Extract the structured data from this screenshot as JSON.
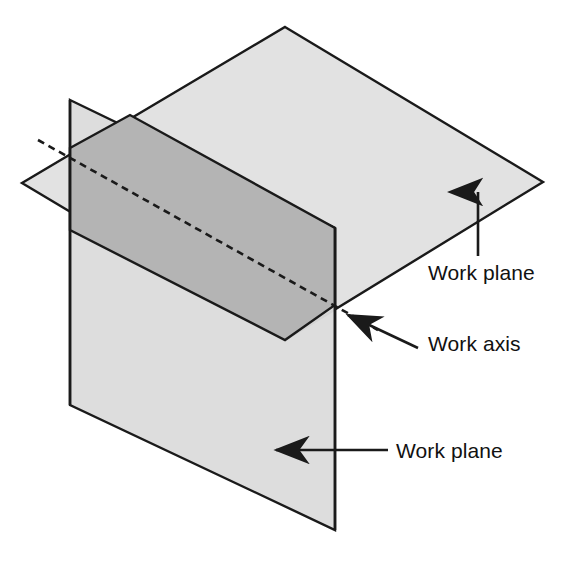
{
  "figure": {
    "background_color": "#ffffff",
    "line_color": "#1a1a1a"
  },
  "colors": {
    "plane_fill": "#dcdcdc",
    "plane_fill_light": "#e2e2e2",
    "overlap_fill": "#b4b4b4",
    "stroke": "#1a1a1a",
    "text": "#111111"
  },
  "geometry": {
    "horizontal_plane": {
      "name": "Work plane (horizontal)",
      "points": "285,27 543,182 285,340 22,183"
    },
    "vertical_plane": {
      "name": "Work plane (vertical)",
      "points": "70,100 335,228 335,530 70,405"
    },
    "overlap_band": {
      "name": "Intersection band",
      "points": "70,148 130,115 335,228 335,305 285,340 70,230"
    },
    "work_axis": {
      "name": "Work axis",
      "x1": 38,
      "y1": 140,
      "x2": 378,
      "y2": 330,
      "dash": "7,5"
    }
  },
  "annotations": [
    {
      "id": "work-plane-top",
      "label": "Work plane",
      "text_x": 428,
      "text_y": 280,
      "arrow": {
        "type": "vertical-up",
        "x1": 478,
        "y1": 256,
        "x2": 478,
        "y2": 192
      }
    },
    {
      "id": "work-axis",
      "label": "Work axis",
      "text_x": 428,
      "text_y": 351,
      "arrow": {
        "type": "diagonal-up-left",
        "x1": 418,
        "y1": 348,
        "x2": 346,
        "y2": 314
      }
    },
    {
      "id": "work-plane-bottom",
      "label": "Work plane",
      "text_x": 396,
      "text_y": 458,
      "arrow": {
        "type": "horizontal-left",
        "x1": 388,
        "y1": 450,
        "x2": 274,
        "y2": 450
      }
    }
  ]
}
